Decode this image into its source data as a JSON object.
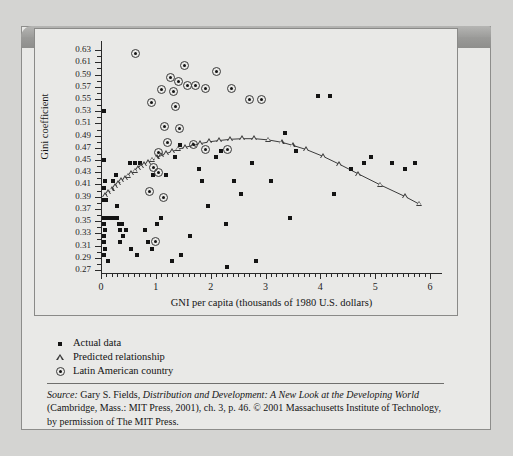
{
  "figure": {
    "number": "FIGURE 5.11",
    "title": "Kuznets Curve with Latin American Countries Identified"
  },
  "legend": {
    "items": [
      {
        "marker": "square-marker",
        "label": "Actual data"
      },
      {
        "marker": "triangle-marker",
        "label": "Predicted relationship"
      },
      {
        "marker": "circled-dot-marker",
        "label": "Latin American country"
      }
    ]
  },
  "source": {
    "lead": "Source:",
    "author": " Gary S. Fields, ",
    "work": "Distribution and Development: A New Look at the Developing World",
    "rest": " (Cambridge, Mass.: MIT Press, 2001), ch. 3, p. 46. © 2001 Massachusetts Institute of Technology, by permission of The MIT Press."
  },
  "chart_data": {
    "type": "scatter",
    "title": "Kuznets Curve with Latin American Countries Identified",
    "xlabel": "GNI per capita (thousands of 1980 U.S. dollars)",
    "ylabel": "Gini coefficient",
    "xlim": [
      0,
      6.2
    ],
    "ylim": [
      0.265,
      0.645
    ],
    "xticks": [
      0,
      1,
      2,
      3,
      4,
      5,
      6
    ],
    "xtick_labels": [
      "0",
      "1",
      "2",
      "3",
      "4",
      "5",
      "6"
    ],
    "x_minor_step": 0.1,
    "yticks": [
      0.27,
      0.29,
      0.31,
      0.33,
      0.35,
      0.37,
      0.39,
      0.41,
      0.43,
      0.45,
      0.47,
      0.49,
      0.51,
      0.53,
      0.55,
      0.57,
      0.59,
      0.61,
      0.63
    ],
    "ytick_labels": [
      "0.27",
      "0.29",
      "0.31",
      "0.33",
      "0.35",
      "0.37",
      "0.39",
      "0.41",
      "0.43",
      "0.45",
      "0.47",
      "0.49",
      "0.51",
      "0.53",
      "0.55",
      "0.57",
      "0.59",
      "0.61",
      "0.63"
    ],
    "grid": false,
    "legend_position": "below-axes-left",
    "series": [
      {
        "name": "Actual data",
        "marker": "square",
        "points": [
          [
            0.05,
            0.53
          ],
          [
            0.06,
            0.45
          ],
          [
            0.07,
            0.415
          ],
          [
            0.06,
            0.405
          ],
          [
            0.05,
            0.385
          ],
          [
            0.09,
            0.385
          ],
          [
            0.05,
            0.355
          ],
          [
            0.1,
            0.355
          ],
          [
            0.16,
            0.355
          ],
          [
            0.06,
            0.345
          ],
          [
            0.07,
            0.335
          ],
          [
            0.06,
            0.325
          ],
          [
            0.05,
            0.315
          ],
          [
            0.07,
            0.305
          ],
          [
            0.06,
            0.295
          ],
          [
            0.13,
            0.285
          ],
          [
            0.22,
            0.355
          ],
          [
            0.3,
            0.355
          ],
          [
            0.33,
            0.345
          ],
          [
            0.35,
            0.335
          ],
          [
            0.38,
            0.345
          ],
          [
            0.3,
            0.375
          ],
          [
            0.41,
            0.325
          ],
          [
            0.46,
            0.335
          ],
          [
            0.35,
            0.315
          ],
          [
            0.22,
            0.415
          ],
          [
            0.28,
            0.425
          ],
          [
            0.52,
            0.445
          ],
          [
            0.62,
            0.445
          ],
          [
            0.72,
            0.445
          ],
          [
            0.55,
            0.305
          ],
          [
            0.66,
            0.295
          ],
          [
            0.8,
            0.335
          ],
          [
            0.86,
            0.315
          ],
          [
            0.93,
            0.305
          ],
          [
            1.02,
            0.345
          ],
          [
            1.1,
            0.355
          ],
          [
            0.95,
            0.425
          ],
          [
            1.18,
            0.425
          ],
          [
            1.35,
            0.455
          ],
          [
            1.44,
            0.475
          ],
          [
            1.3,
            0.285
          ],
          [
            1.45,
            0.295
          ],
          [
            1.62,
            0.325
          ],
          [
            1.78,
            0.435
          ],
          [
            1.85,
            0.415
          ],
          [
            1.95,
            0.375
          ],
          [
            2.1,
            0.455
          ],
          [
            2.18,
            0.465
          ],
          [
            2.3,
            0.275
          ],
          [
            2.42,
            0.415
          ],
          [
            2.55,
            0.395
          ],
          [
            2.28,
            0.345
          ],
          [
            2.75,
            0.445
          ],
          [
            2.82,
            0.285
          ],
          [
            3.1,
            0.415
          ],
          [
            3.35,
            0.495
          ],
          [
            3.55,
            0.465
          ],
          [
            3.45,
            0.355
          ],
          [
            3.95,
            0.555
          ],
          [
            4.18,
            0.555
          ],
          [
            4.25,
            0.395
          ],
          [
            4.55,
            0.435
          ],
          [
            4.8,
            0.445
          ],
          [
            4.92,
            0.455
          ],
          [
            5.3,
            0.445
          ],
          [
            5.55,
            0.435
          ],
          [
            5.72,
            0.445
          ]
        ]
      },
      {
        "name": "Predicted relationship",
        "marker": "triangle",
        "line": true,
        "points": [
          [
            0.08,
            0.392
          ],
          [
            0.14,
            0.397
          ],
          [
            0.2,
            0.402
          ],
          [
            0.26,
            0.407
          ],
          [
            0.32,
            0.412
          ],
          [
            0.38,
            0.416
          ],
          [
            0.44,
            0.42
          ],
          [
            0.5,
            0.424
          ],
          [
            0.56,
            0.428
          ],
          [
            0.62,
            0.432
          ],
          [
            0.68,
            0.436
          ],
          [
            0.74,
            0.44
          ],
          [
            0.8,
            0.443
          ],
          [
            0.86,
            0.446
          ],
          [
            0.94,
            0.45
          ],
          [
            1.02,
            0.454
          ],
          [
            1.1,
            0.457
          ],
          [
            1.2,
            0.461
          ],
          [
            1.3,
            0.464
          ],
          [
            1.42,
            0.468
          ],
          [
            1.54,
            0.471
          ],
          [
            1.68,
            0.474
          ],
          [
            1.82,
            0.477
          ],
          [
            1.98,
            0.48
          ],
          [
            2.16,
            0.482
          ],
          [
            2.36,
            0.484
          ],
          [
            2.58,
            0.485
          ],
          [
            2.8,
            0.485
          ],
          [
            3.05,
            0.483
          ],
          [
            3.3,
            0.479
          ],
          [
            3.5,
            0.474
          ],
          [
            3.75,
            0.467
          ],
          [
            4.05,
            0.456
          ],
          [
            4.35,
            0.443
          ],
          [
            4.7,
            0.427
          ],
          [
            5.1,
            0.409
          ],
          [
            5.55,
            0.39
          ],
          [
            5.8,
            0.378
          ]
        ]
      },
      {
        "name": "Latin American country",
        "marker": "circled-dot",
        "points": [
          [
            0.62,
            0.625
          ],
          [
            1.52,
            0.605
          ],
          [
            2.1,
            0.595
          ],
          [
            1.26,
            0.585
          ],
          [
            1.42,
            0.578
          ],
          [
            1.58,
            0.572
          ],
          [
            1.72,
            0.572
          ],
          [
            1.9,
            0.568
          ],
          [
            2.38,
            0.568
          ],
          [
            1.1,
            0.565
          ],
          [
            1.32,
            0.563
          ],
          [
            2.7,
            0.55
          ],
          [
            2.92,
            0.55
          ],
          [
            0.92,
            0.545
          ],
          [
            1.36,
            0.538
          ],
          [
            1.16,
            0.505
          ],
          [
            1.44,
            0.502
          ],
          [
            1.22,
            0.478
          ],
          [
            1.05,
            0.462
          ],
          [
            0.96,
            0.438
          ],
          [
            1.04,
            0.43
          ],
          [
            0.88,
            0.398
          ],
          [
            1.14,
            0.388
          ],
          [
            1.68,
            0.475
          ],
          [
            1.9,
            0.468
          ],
          [
            1.0,
            0.316
          ],
          [
            2.3,
            0.468
          ]
        ]
      }
    ]
  }
}
